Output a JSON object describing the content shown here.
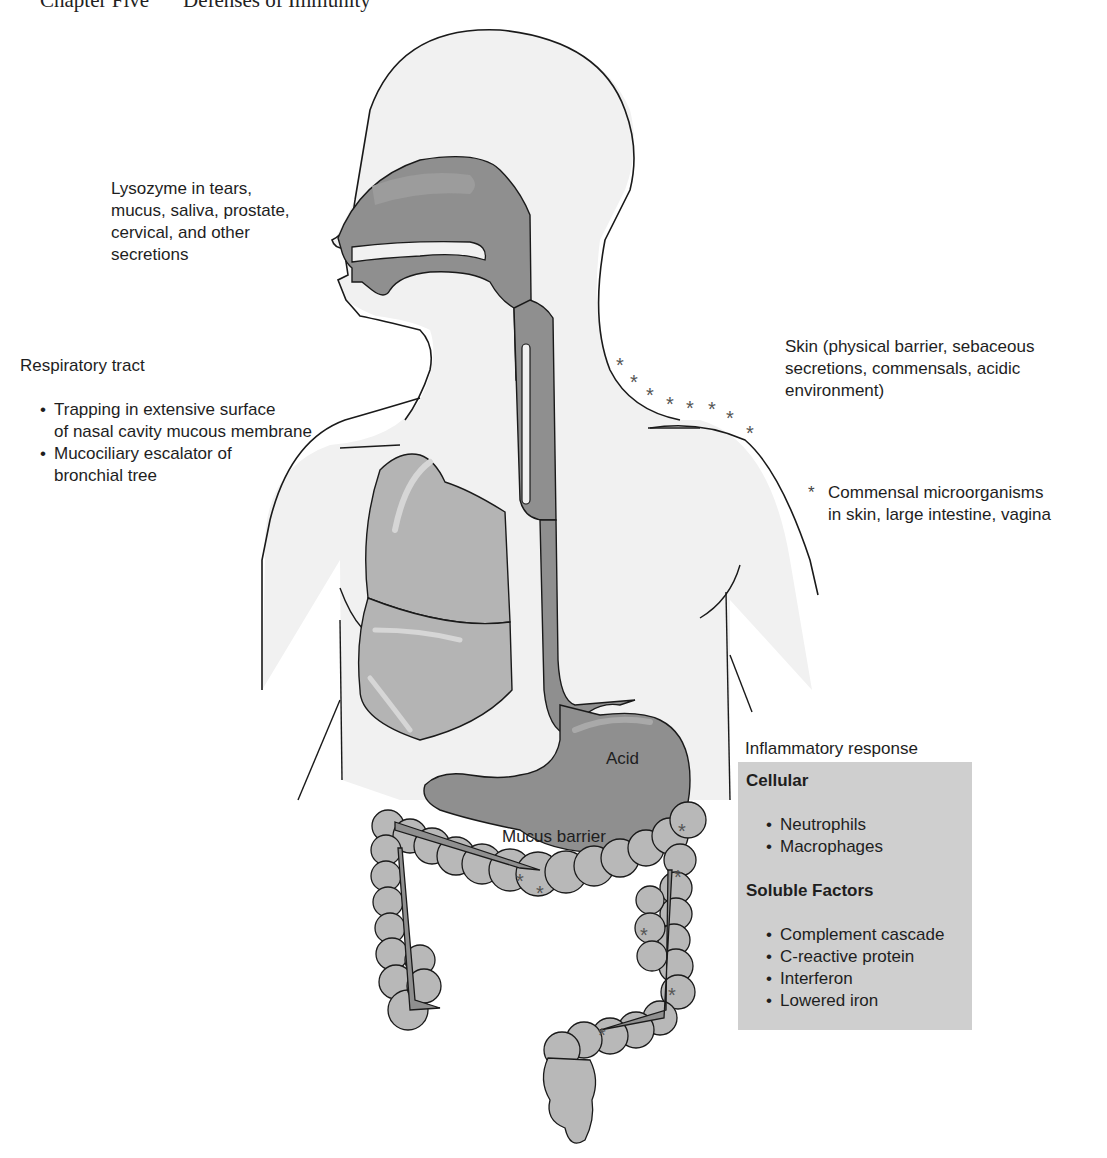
{
  "header": {
    "chapter": "Chapter Five",
    "title": "Defenses of Immunity"
  },
  "labels": {
    "lysozyme": {
      "lines": [
        "Lysozyme in tears,",
        "mucus, saliva, prostate,",
        "cervical, and other",
        "secretions"
      ]
    },
    "respiratory": {
      "title": "Respiratory tract",
      "items": [
        {
          "line1": "Trapping in extensive surface",
          "line2": "of nasal cavity mucous membrane"
        },
        {
          "line1": "Mucociliary escalator of",
          "line2": "bronchial tree"
        }
      ]
    },
    "skin": {
      "lines": [
        "Skin (physical barrier, sebaceous",
        "secretions, commensals, acidic",
        "environment)"
      ]
    },
    "commensal": {
      "marker": "*",
      "line1": "Commensal microorganisms",
      "line2": "in skin, large intestine, vagina"
    },
    "stomach": {
      "acid": "Acid",
      "mucus": "Mucus barrier"
    }
  },
  "inflammatory": {
    "title": "Inflammatory response",
    "cellular": {
      "heading": "Cellular",
      "items": [
        "Neutrophils",
        "Macrophages"
      ]
    },
    "soluble": {
      "heading": "Soluble Factors",
      "items": [
        "Complement cascade",
        "C-reactive protein",
        "Interferon",
        "Lowered iron"
      ]
    }
  },
  "colors": {
    "body_fill": "#f1f1f1",
    "organ_dark": "#8f8f8f",
    "organ_mid": "#a9a9a9",
    "lung": "#b4b4b4",
    "intestine": "#b8b8b8",
    "outline": "#1a1a1a",
    "box_fill": "#cfcfcf",
    "star": "#555555"
  }
}
